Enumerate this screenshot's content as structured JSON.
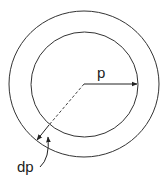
{
  "diagram": {
    "type": "concentric-circles",
    "labels": {
      "radius": "p",
      "thickness": "dp"
    },
    "colors": {
      "stroke": "#333333",
      "background": "#ffffff"
    }
  }
}
